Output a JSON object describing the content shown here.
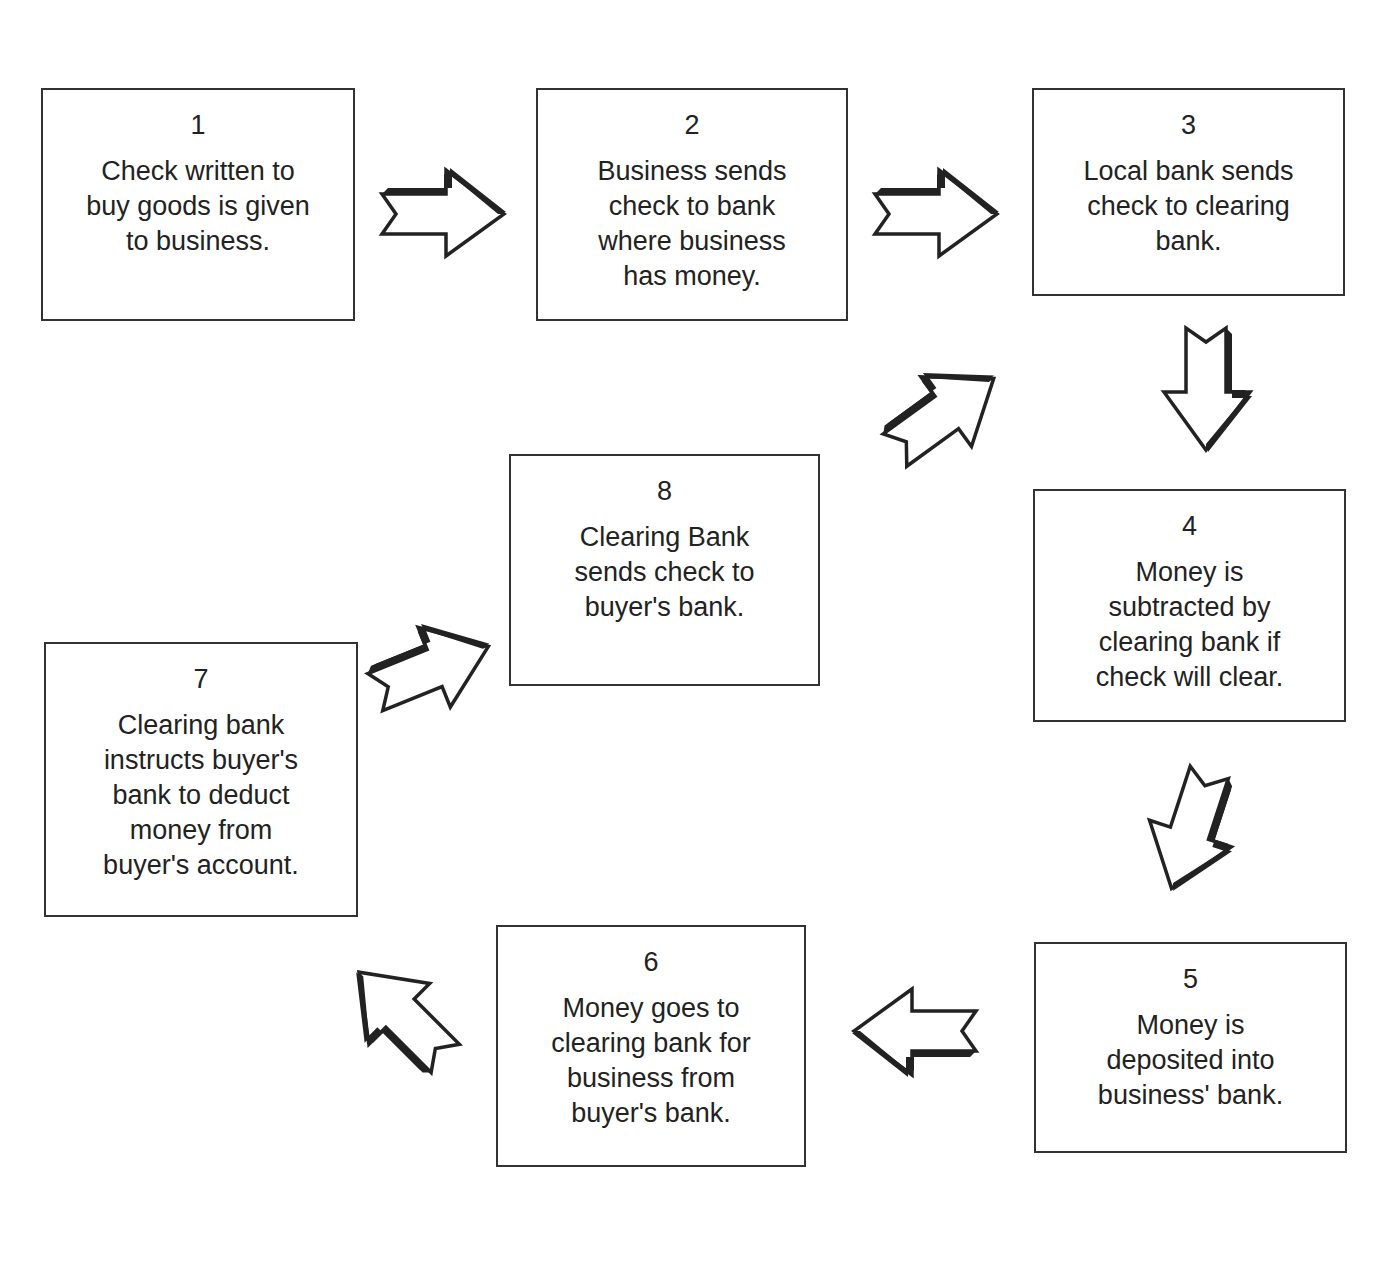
{
  "diagram": {
    "steps": [
      {
        "num": "1",
        "text": "Check written to\nbuy goods is given\nto business."
      },
      {
        "num": "2",
        "text": "Business sends\ncheck to bank\nwhere business\nhas money."
      },
      {
        "num": "3",
        "text": "Local bank sends\ncheck to clearing\nbank."
      },
      {
        "num": "4",
        "text": "Money is\nsubtracted by\nclearing bank if\ncheck will clear."
      },
      {
        "num": "5",
        "text": "Money is\ndeposited into\nbusiness' bank."
      },
      {
        "num": "6",
        "text": "Money goes to\nclearing bank for\nbusiness from\nbuyer's bank."
      },
      {
        "num": "7",
        "text": "Clearing bank\ninstructs buyer's\nbank to deduct\nmoney from\nbuyer's account."
      },
      {
        "num": "8",
        "text": "Clearing Bank\nsends check to\nbuyer's bank."
      }
    ],
    "arrows": [
      {
        "from": "1",
        "to": "2",
        "direction": "right"
      },
      {
        "from": "2",
        "to": "3",
        "direction": "right"
      },
      {
        "from": "3",
        "to": "4",
        "direction": "down"
      },
      {
        "from": "4",
        "to": "5",
        "direction": "down-left"
      },
      {
        "from": "5",
        "to": "6",
        "direction": "left"
      },
      {
        "from": "6",
        "to": "7",
        "direction": "up-left"
      },
      {
        "from": "7",
        "to": "8",
        "direction": "up-right"
      },
      {
        "from": "8",
        "to": "3",
        "direction": "up-right"
      }
    ],
    "colors": {
      "stroke": "#333333",
      "shadow": "#222222",
      "fill": "#ffffff"
    }
  }
}
